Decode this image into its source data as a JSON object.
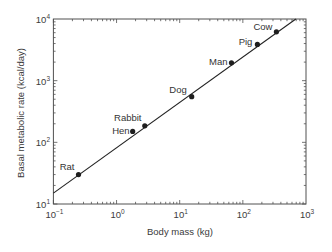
{
  "chart_data": {
    "type": "scatter",
    "title": "",
    "xlabel": "Body mass (kg)",
    "ylabel": "Basal metabolic rate (kcal/day)",
    "xscale": "log",
    "yscale": "log",
    "xlim": [
      0.1,
      1000
    ],
    "ylim": [
      10,
      10000
    ],
    "grid": false,
    "legend": null,
    "x_ticks": [
      {
        "value": 0.1,
        "base": "10",
        "exp": "−1"
      },
      {
        "value": 1,
        "base": "10",
        "exp": "0"
      },
      {
        "value": 10,
        "base": "10",
        "exp": "1"
      },
      {
        "value": 100,
        "base": "10",
        "exp": "2"
      },
      {
        "value": 1000,
        "base": "10",
        "exp": "3"
      }
    ],
    "y_ticks": [
      {
        "value": 10,
        "base": "10",
        "exp": "1"
      },
      {
        "value": 100,
        "base": "10",
        "exp": "2"
      },
      {
        "value": 1000,
        "base": "10",
        "exp": "3"
      },
      {
        "value": 10000,
        "base": "10",
        "exp": "4"
      }
    ],
    "series": [
      {
        "name": "Animals",
        "points": [
          {
            "label": "Rat",
            "x": 0.25,
            "y": 30,
            "label_anchor": "end",
            "label_dx": -4,
            "label_dy": -5
          },
          {
            "label": "Hen",
            "x": 1.8,
            "y": 150,
            "label_anchor": "end",
            "label_dx": -3,
            "label_dy": 3
          },
          {
            "label": "Rabbit",
            "x": 2.8,
            "y": 185,
            "label_anchor": "middle",
            "label_dx": -17,
            "label_dy": -5
          },
          {
            "label": "Dog",
            "x": 15.5,
            "y": 550,
            "label_anchor": "end",
            "label_dx": -5,
            "label_dy": -4
          },
          {
            "label": "Man",
            "x": 66,
            "y": 1950,
            "label_anchor": "end",
            "label_dx": -4,
            "label_dy": 2
          },
          {
            "label": "Pig",
            "x": 170,
            "y": 3870,
            "label_anchor": "end",
            "label_dx": -5,
            "label_dy": 1
          },
          {
            "label": "Cow",
            "x": 340,
            "y": 6200,
            "label_anchor": "end",
            "label_dx": -4,
            "label_dy": -2
          }
        ]
      }
    ],
    "fit_line": {
      "x": [
        0.1,
        690
      ],
      "y": [
        15,
        10000
      ]
    }
  },
  "colors": {
    "axis": "#505050",
    "fit_line": "#222222",
    "point": "#1e1e1e",
    "text": "#333333",
    "background": "#ffffff"
  }
}
